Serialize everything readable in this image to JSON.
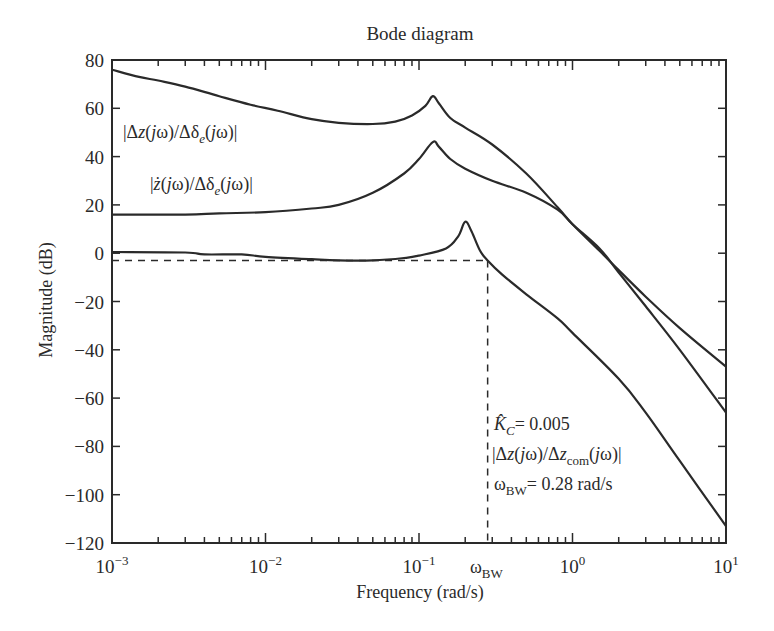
{
  "chart_data": {
    "type": "line",
    "title": "Bode diagram",
    "xlabel": "Frequency (rad/s)",
    "ylabel": "Magnitude (dB)",
    "xscale": "log",
    "xlim": [
      0.001,
      10
    ],
    "ylim": [
      -120,
      80
    ],
    "grid": false,
    "x_ticks": [
      {
        "value": 0.001,
        "label": "10",
        "exp": "−3"
      },
      {
        "value": 0.01,
        "label": "10",
        "exp": "−2"
      },
      {
        "value": 0.1,
        "label": "10",
        "exp": "−1"
      },
      {
        "value": 1,
        "label": "10",
        "exp": "0"
      },
      {
        "value": 10,
        "label": "10",
        "exp": "1"
      }
    ],
    "y_ticks": [
      80,
      60,
      40,
      20,
      0,
      -20,
      -40,
      -60,
      -80,
      -100,
      -120
    ],
    "y_tick_labels": [
      "80",
      "60",
      "40",
      "20",
      "0",
      "−20",
      "−40",
      "−60",
      "−80",
      "−100",
      "−120"
    ],
    "series": [
      {
        "name": "|Δz(jω)/Δδe(jω)|",
        "points": [
          [
            0.001,
            76
          ],
          [
            0.0015,
            73
          ],
          [
            0.002,
            71.5
          ],
          [
            0.003,
            69
          ],
          [
            0.005,
            65
          ],
          [
            0.008,
            61.5
          ],
          [
            0.012,
            59
          ],
          [
            0.02,
            55.5
          ],
          [
            0.03,
            54
          ],
          [
            0.05,
            53.5
          ],
          [
            0.07,
            54.5
          ],
          [
            0.09,
            57
          ],
          [
            0.11,
            61
          ],
          [
            0.123,
            65
          ],
          [
            0.135,
            62
          ],
          [
            0.16,
            56
          ],
          [
            0.2,
            52
          ],
          [
            0.3,
            45
          ],
          [
            0.5,
            33
          ],
          [
            0.8,
            19
          ],
          [
            1,
            12
          ],
          [
            1.5,
            1
          ],
          [
            2,
            -7
          ],
          [
            3,
            -18
          ],
          [
            5,
            -31
          ],
          [
            10,
            -47
          ]
        ]
      },
      {
        "name": "|ż(jω)/Δδe(jω)|",
        "points": [
          [
            0.001,
            16
          ],
          [
            0.003,
            16
          ],
          [
            0.005,
            16.5
          ],
          [
            0.01,
            17
          ],
          [
            0.02,
            18.5
          ],
          [
            0.03,
            20
          ],
          [
            0.05,
            25
          ],
          [
            0.08,
            33
          ],
          [
            0.1,
            39
          ],
          [
            0.123,
            46
          ],
          [
            0.135,
            44
          ],
          [
            0.16,
            39
          ],
          [
            0.2,
            35
          ],
          [
            0.3,
            30
          ],
          [
            0.5,
            25
          ],
          [
            0.8,
            18
          ],
          [
            1,
            12
          ],
          [
            1.5,
            2
          ],
          [
            2,
            -8
          ],
          [
            3,
            -22
          ],
          [
            5,
            -40
          ],
          [
            10,
            -66
          ]
        ]
      },
      {
        "name": "|Δz(jω)/Δzcom(jω)|",
        "points": [
          [
            0.001,
            0.5
          ],
          [
            0.003,
            0.3
          ],
          [
            0.004,
            -0.5
          ],
          [
            0.007,
            -0.5
          ],
          [
            0.01,
            -1.5
          ],
          [
            0.02,
            -2.5
          ],
          [
            0.03,
            -3
          ],
          [
            0.05,
            -3
          ],
          [
            0.08,
            -2
          ],
          [
            0.1,
            -1
          ],
          [
            0.15,
            2
          ],
          [
            0.18,
            7
          ],
          [
            0.2,
            13
          ],
          [
            0.22,
            9
          ],
          [
            0.25,
            1
          ],
          [
            0.28,
            -3
          ],
          [
            0.35,
            -9
          ],
          [
            0.5,
            -17
          ],
          [
            0.8,
            -27
          ],
          [
            1,
            -33
          ],
          [
            2,
            -52
          ],
          [
            3,
            -66
          ],
          [
            5,
            -86
          ],
          [
            10,
            -113
          ]
        ]
      }
    ],
    "reference_lines": [
      {
        "type": "horizontal",
        "y": -3,
        "x_range": [
          0.001,
          0.28
        ],
        "style": "dashed"
      },
      {
        "type": "vertical",
        "x": 0.28,
        "y_range": [
          -120,
          -3
        ],
        "style": "dashed"
      }
    ],
    "annotations": [
      {
        "text": "|Δz(jω)/Δδe(jω)|",
        "series": 0
      },
      {
        "text": "|ż(jω)/Δδe(jω)|",
        "series": 1
      },
      {
        "text": "K̂C = 0.005"
      },
      {
        "text": "|Δz(jω)/Δzcom(jω)|",
        "series": 2
      },
      {
        "text": "ωBW = 0.28 rad/s"
      },
      {
        "text": "ωBW",
        "position": "x-axis tick at 0.28"
      }
    ]
  },
  "labels": {
    "title": "Bode diagram",
    "xlabel": "Frequency (rad/s)",
    "ylabel": "Magnitude (dB)",
    "omega_bw_tick": "ω",
    "omega_bw_sub": "BW",
    "kc_value": "= 0.005",
    "kc_sub": "C",
    "bw_value": "= 0.28 rad/s"
  }
}
